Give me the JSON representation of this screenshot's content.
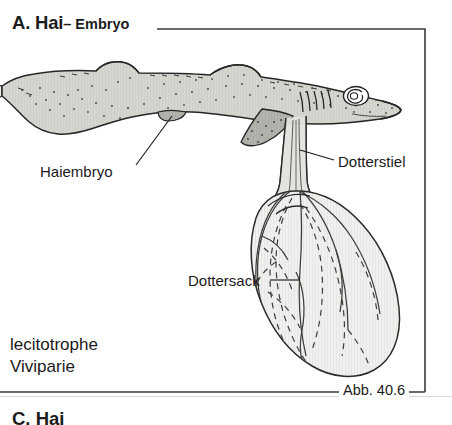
{
  "figure": {
    "panel_letter_title": "A. Hai",
    "panel_subtitle": "– Embryo",
    "figure_number": "Abb. 40.6",
    "mode_caption_line1": "lecitotrophe",
    "mode_caption_line2": "Viviparie",
    "next_section_partial": "C. Hai",
    "labels": {
      "embryo": "Haiembryo",
      "yolk_stalk": "Dotterstiel",
      "yolk_sac": "Dottersack"
    },
    "colors": {
      "ink": "#1c1c1c",
      "rule": "#3a3a3a",
      "body_fill": "#d6d4cf",
      "fin_fill": "#b3b1ab",
      "yolk_fill": "#efefed",
      "vessel": "#3d3d3d",
      "stipple": "#4a4a48",
      "page_background": "#ffffff"
    },
    "anatomy": {
      "parts": [
        "tail-fin",
        "caudal-body",
        "dorsal-fin-first",
        "dorsal-fin-second",
        "pelvic-fin",
        "pectoral-fin",
        "gill-slits",
        "eye",
        "snout",
        "yolk-stalk",
        "yolk-sac",
        "yolk-vessels"
      ],
      "gill_slit_count": 5
    }
  }
}
